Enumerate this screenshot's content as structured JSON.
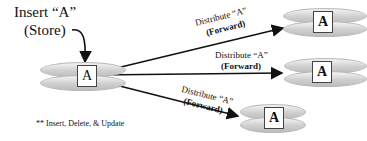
{
  "source": {
    "label_line1": "Insert “A”",
    "label_line2": "(Store)",
    "box_letter": "A"
  },
  "targets": [
    {
      "box_letter": "A",
      "edge_line1": "Distribute “A”",
      "edge_line2": "(Forward)"
    },
    {
      "box_letter": "A",
      "edge_line1": "Distribute “A”",
      "edge_line2": "(Forward)"
    },
    {
      "box_letter": "A",
      "edge_line1": "Distribute “A”",
      "edge_line2": "(Forward)"
    }
  ],
  "footnote": "** Insert, Delete, & Update"
}
